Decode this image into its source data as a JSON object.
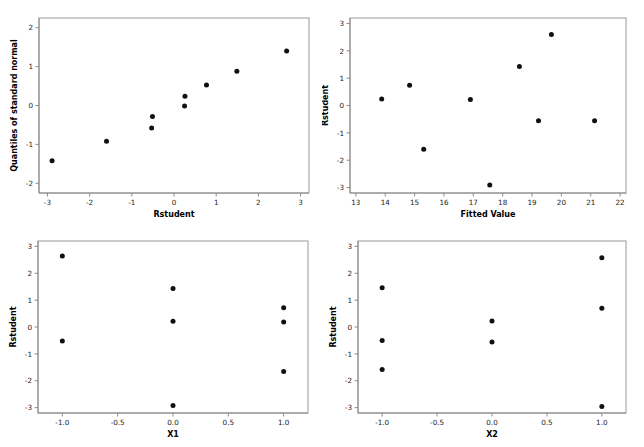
{
  "figure": {
    "title_cut_off": "",
    "background_color": "#ffffff",
    "point_color": "#101010",
    "frame_color": "#9a9a9a",
    "panel_count": 4
  },
  "chart_data": [
    {
      "id": "qq-plot",
      "type": "scatter",
      "title": "",
      "xlabel": "Rstudent",
      "ylabel": "Quantiles of standard normal",
      "xlim": [
        -3.2,
        3.2
      ],
      "ylim": [
        -2.25,
        2.25
      ],
      "xticks": [
        -3,
        -2,
        -1,
        0,
        1,
        2,
        3
      ],
      "xticklabels": [
        "-3",
        "-2",
        "-1",
        "0",
        "1",
        "2",
        "3"
      ],
      "yticks": [
        -2,
        -1,
        0,
        1,
        2
      ],
      "yticklabels": [
        "-2",
        "-1",
        "0",
        "1",
        "2"
      ],
      "grid": false,
      "legend": false,
      "points": [
        {
          "x": -2.89,
          "y": -1.42
        },
        {
          "x": -1.6,
          "y": -0.92
        },
        {
          "x": -0.53,
          "y": -0.58
        },
        {
          "x": -0.51,
          "y": -0.28
        },
        {
          "x": 0.25,
          "y": -0.01
        },
        {
          "x": 0.26,
          "y": 0.24
        },
        {
          "x": 0.77,
          "y": 0.53
        },
        {
          "x": 1.49,
          "y": 0.88
        },
        {
          "x": 2.67,
          "y": 1.4
        }
      ]
    },
    {
      "id": "residual-vs-fitted",
      "type": "scatter",
      "title": "",
      "xlabel": "Fitted Value",
      "ylabel": "Rstudent",
      "xlim": [
        12.8,
        22.2
      ],
      "ylim": [
        -3.2,
        3.2
      ],
      "xticks": [
        13,
        14,
        15,
        16,
        17,
        18,
        19,
        20,
        21,
        22
      ],
      "xticklabels": [
        "13",
        "14",
        "15",
        "16",
        "17",
        "18",
        "19",
        "20",
        "21",
        "22"
      ],
      "yticks": [
        -3,
        -2,
        -1,
        0,
        1,
        2,
        3
      ],
      "yticklabels": [
        "-3",
        "-2",
        "-1",
        "0",
        "1",
        "2",
        "3"
      ],
      "grid": false,
      "legend": false,
      "points": [
        {
          "x": 13.88,
          "y": 0.24
        },
        {
          "x": 14.83,
          "y": 0.74
        },
        {
          "x": 15.31,
          "y": -1.6
        },
        {
          "x": 16.9,
          "y": 0.22
        },
        {
          "x": 17.56,
          "y": -2.91
        },
        {
          "x": 18.57,
          "y": 1.43
        },
        {
          "x": 19.22,
          "y": -0.56
        },
        {
          "x": 19.66,
          "y": 2.6
        },
        {
          "x": 21.13,
          "y": -0.56
        }
      ]
    },
    {
      "id": "residual-vs-x1",
      "type": "scatter",
      "title": "",
      "xlabel": "X1",
      "ylabel": "Rstudent",
      "xlim": [
        -1.22,
        1.22
      ],
      "ylim": [
        -3.2,
        3.2
      ],
      "xticks": [
        -1.0,
        -0.5,
        0.0,
        0.5,
        1.0
      ],
      "xticklabels": [
        "-1.0",
        "-0.5",
        "0.0",
        "0.5",
        "1.0"
      ],
      "yticks": [
        -3,
        -2,
        -1,
        0,
        1,
        2,
        3
      ],
      "yticklabels": [
        "-3",
        "-2",
        "-1",
        "0",
        "1",
        "2",
        "3"
      ],
      "grid": false,
      "legend": false,
      "points": [
        {
          "x": -1.0,
          "y": 2.64
        },
        {
          "x": -1.0,
          "y": -0.52
        },
        {
          "x": 0.0,
          "y": 1.43
        },
        {
          "x": 0.0,
          "y": 0.21
        },
        {
          "x": 0.0,
          "y": -2.92
        },
        {
          "x": 1.0,
          "y": 0.72
        },
        {
          "x": 1.0,
          "y": 0.19
        },
        {
          "x": 1.0,
          "y": -1.66
        }
      ]
    },
    {
      "id": "residual-vs-x2",
      "type": "scatter",
      "title": "",
      "xlabel": "X2",
      "ylabel": "Rstudent",
      "xlim": [
        -1.22,
        1.22
      ],
      "ylim": [
        -3.2,
        3.2
      ],
      "xticks": [
        -1.0,
        -0.5,
        0.0,
        0.5,
        1.0
      ],
      "xticklabels": [
        "-1.0",
        "-0.5",
        "0.0",
        "0.5",
        "1.0"
      ],
      "yticks": [
        -3,
        -2,
        -1,
        0,
        1,
        2,
        3
      ],
      "yticklabels": [
        "-3",
        "-2",
        "-1",
        "0",
        "1",
        "2",
        "3"
      ],
      "grid": false,
      "legend": false,
      "points": [
        {
          "x": -1.0,
          "y": 1.46
        },
        {
          "x": -1.0,
          "y": -0.5
        },
        {
          "x": -1.0,
          "y": -1.58
        },
        {
          "x": 0.0,
          "y": 0.22
        },
        {
          "x": 0.0,
          "y": -0.56
        },
        {
          "x": 1.0,
          "y": 2.58
        },
        {
          "x": 1.0,
          "y": 0.7
        },
        {
          "x": 1.0,
          "y": -2.96
        }
      ]
    }
  ]
}
